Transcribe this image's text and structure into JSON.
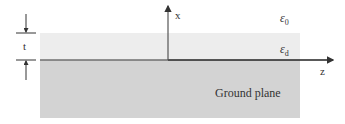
{
  "diagram": {
    "type": "grounded-dielectric-slab",
    "labels": {
      "x_axis": "x",
      "z_axis": "z",
      "thickness": "t",
      "eps_free_space_symbol": "ε",
      "eps_free_space_sub": "0",
      "eps_dielectric_symbol": "ε",
      "eps_dielectric_sub": "d",
      "ground_plane": "Ground plane"
    },
    "colors": {
      "dielectric": "#ededed",
      "ground": "#d3d3d3",
      "interface": "#6e6e6e",
      "axis": "#333333"
    }
  }
}
